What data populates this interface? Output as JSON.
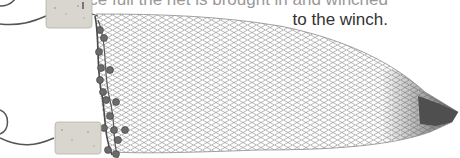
{
  "illustration": {
    "subject": "trawl-net",
    "caption_lines": [
      "Once full the net is brought in and winched",
      "to the winch."
    ],
    "caption_visible_line": "to the winch.",
    "elements": {
      "floats": 2,
      "net_color": "#7a7a7a",
      "cork_color": "#d8d6cf",
      "rope_color": "#4a4a4a",
      "bead_color": "#6b6b6b"
    }
  }
}
